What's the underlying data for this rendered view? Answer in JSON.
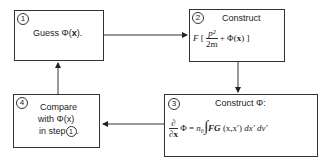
{
  "steps": [
    {
      "number": "1",
      "text": "Guess Φ(",
      "var": "x",
      "end": ")."
    },
    {
      "number": "2",
      "title": "Construct",
      "F": "F",
      "lbracket": "[",
      "frac_num": "p²",
      "frac_den": "2m",
      "plus": "+ Φ(",
      "var": "x",
      "end": ") ]"
    },
    {
      "number": "3",
      "title": "Construct Φ:",
      "partial_num": "∂",
      "partial_den": "∂x",
      "eq": "Φ = ",
      "n0": "n₀",
      "integral": "∫",
      "fg": "FG",
      "args": "(x,x′)",
      "tail": "dx′ dv′"
    },
    {
      "number": "4",
      "line1": "Compare",
      "line2": "with Φ(x)",
      "line3_prefix": "in step",
      "line3_ref": "1",
      "line3_suffix": "."
    }
  ]
}
